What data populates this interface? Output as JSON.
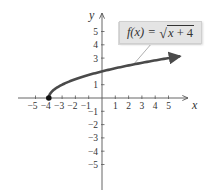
{
  "chart_data": {
    "type": "line",
    "title": "",
    "function_label": "f(x) = √(x + 4)",
    "function_label_parts": {
      "lhs": "f(x)",
      "equals": "=",
      "radical": "√",
      "radicand_var": "x",
      "radicand_rest": " + 4"
    },
    "xlabel": "x",
    "ylabel": "y",
    "xlim": [
      -6,
      6
    ],
    "ylim": [
      -6,
      6
    ],
    "x_ticks": [
      -5,
      -4,
      -3,
      -2,
      -1,
      1,
      2,
      3,
      4,
      5
    ],
    "y_ticks": [
      -5,
      -4,
      -3,
      -2,
      -1,
      1,
      3,
      4,
      5
    ],
    "x_tick_labels": [
      "−5",
      "−4",
      "−3",
      "−2",
      "−1",
      "1",
      "2",
      "3",
      "4",
      "5"
    ],
    "y_tick_labels": [
      "−5",
      "−4",
      "−3",
      "−2",
      "−1",
      "1",
      "3",
      "4",
      "5"
    ],
    "grid": false,
    "series": [
      {
        "name": "f(x) = √(x + 4)",
        "x": [
          -4,
          -3.75,
          -3.5,
          -3,
          -2,
          -1,
          0,
          1,
          2,
          3,
          4,
          5,
          5.8
        ],
        "y": [
          0,
          0.5,
          0.71,
          1,
          1.41,
          1.73,
          2,
          2.24,
          2.45,
          2.65,
          2.83,
          3,
          3.13
        ],
        "color": "#4a4a4a",
        "end_arrow": true
      }
    ],
    "points": [
      {
        "x": -4,
        "y": 0,
        "filled": true,
        "color": "#111111"
      }
    ]
  },
  "colors": {
    "axis": "#555555",
    "curve": "#4a4a4a",
    "label_bg": "#e4e4e4",
    "text": "#333333"
  }
}
